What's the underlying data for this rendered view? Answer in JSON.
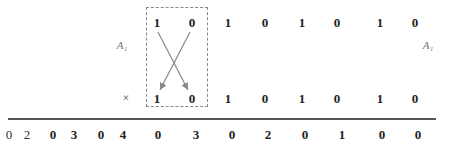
{
  "labels": {
    "left": "A₁",
    "right": "A₁",
    "multiply": "×"
  },
  "row_top": {
    "boxed": [
      "1",
      "0"
    ],
    "rest": [
      "1",
      "0",
      "1",
      "0",
      "1",
      "0"
    ]
  },
  "row_bottom": {
    "boxed": [
      "1",
      "0"
    ],
    "rest": [
      "1",
      "0",
      "1",
      "0",
      "1",
      "0"
    ]
  },
  "result": [
    "0",
    "2",
    "0",
    "3",
    "0",
    "4",
    "0",
    "3",
    "0",
    "2",
    "0",
    "1",
    "0",
    "0"
  ],
  "colors": {
    "box_border": "#888888",
    "arrow": "#888888",
    "rule": "#555555"
  }
}
